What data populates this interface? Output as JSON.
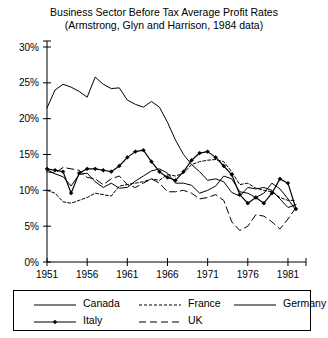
{
  "chart_data": {
    "type": "line",
    "title": "Business Sector Before Tax Average Profit Rates",
    "subtitle": "(Armstrong, Glyn and Harrison, 1984 data)",
    "xlabel": "",
    "ylabel": "",
    "xlim": [
      1951,
      1982
    ],
    "ylim": [
      0,
      30
    ],
    "grid": false,
    "legend_position": "bottom",
    "x_tick_labels": [
      "1951",
      "1956",
      "1961",
      "1966",
      "1971",
      "1976",
      "1981"
    ],
    "x_ticks": [
      1951,
      1956,
      1961,
      1966,
      1971,
      1976,
      1981
    ],
    "y_tick_labels": [
      "0%",
      "5%",
      "10%",
      "15%",
      "20%",
      "25%",
      "30%"
    ],
    "y_ticks": [
      0,
      5,
      10,
      15,
      20,
      25,
      30
    ],
    "x": [
      1951,
      1952,
      1953,
      1954,
      1955,
      1956,
      1957,
      1958,
      1959,
      1960,
      1961,
      1962,
      1963,
      1964,
      1965,
      1966,
      1967,
      1968,
      1969,
      1970,
      1971,
      1972,
      1973,
      1974,
      1975,
      1976,
      1977,
      1978,
      1979,
      1980,
      1981,
      1982
    ],
    "series": [
      {
        "name": "Canada",
        "style": "solid",
        "marker": "none",
        "color": "#000000",
        "values": [
          12.9,
          12.3,
          11.9,
          10.6,
          12.2,
          12.4,
          11.2,
          10.4,
          11.0,
          10.3,
          10.4,
          11.3,
          12.0,
          12.7,
          13.0,
          12.4,
          11.0,
          11.0,
          10.7,
          9.6,
          10.0,
          10.6,
          12.0,
          11.6,
          9.8,
          9.6,
          9.0,
          9.6,
          11.0,
          10.2,
          8.8,
          7.2
        ]
      },
      {
        "name": "France",
        "style": "dotted",
        "marker": "none",
        "color": "#000000",
        "values": [
          10.0,
          9.6,
          8.4,
          8.2,
          8.6,
          9.0,
          9.6,
          9.4,
          9.2,
          10.6,
          10.8,
          11.0,
          11.2,
          11.6,
          11.4,
          12.2,
          12.0,
          12.4,
          13.6,
          14.0,
          14.2,
          14.3,
          14.0,
          12.6,
          10.8,
          11.0,
          10.3,
          10.0,
          9.8,
          9.0,
          8.6,
          8.6
        ]
      },
      {
        "name": "Germany",
        "style": "solid",
        "marker": "none",
        "color": "#000000",
        "values": [
          21.5,
          24.0,
          24.8,
          24.4,
          23.8,
          23.0,
          25.8,
          24.8,
          24.2,
          24.3,
          22.6,
          22.0,
          21.6,
          22.4,
          21.6,
          19.5,
          17.0,
          15.0,
          13.6,
          12.6,
          11.4,
          11.6,
          11.2,
          9.7,
          9.2,
          10.4,
          10.2,
          10.4,
          10.0,
          8.8,
          7.6,
          8.0
        ]
      },
      {
        "name": "Italy",
        "style": "solid",
        "marker": "diamond",
        "color": "#000000",
        "values": [
          13.0,
          12.8,
          12.6,
          9.6,
          12.4,
          13.0,
          13.0,
          12.8,
          12.6,
          13.4,
          14.6,
          15.4,
          15.6,
          14.0,
          12.6,
          11.8,
          11.4,
          12.6,
          14.2,
          15.2,
          15.4,
          14.6,
          13.4,
          12.2,
          9.4,
          8.2,
          9.0,
          8.2,
          9.6,
          11.6,
          11.0,
          7.4
        ]
      },
      {
        "name": "UK",
        "style": "dashed",
        "marker": "none",
        "color": "#000000",
        "values": [
          12.6,
          12.4,
          13.2,
          13.0,
          12.8,
          11.8,
          11.6,
          10.8,
          11.6,
          12.0,
          10.8,
          10.4,
          11.0,
          11.6,
          11.0,
          9.8,
          9.8,
          10.0,
          9.6,
          8.8,
          9.0,
          9.4,
          8.6,
          5.6,
          4.4,
          5.0,
          6.6,
          6.4,
          5.6,
          4.6,
          6.0,
          7.6
        ]
      }
    ]
  },
  "legend": {
    "items": [
      {
        "label": "Canada",
        "style": "solid",
        "marker": "none"
      },
      {
        "label": "France",
        "style": "dotted",
        "marker": "none"
      },
      {
        "label": "Germany",
        "style": "solid",
        "marker": "none"
      },
      {
        "label": "Italy",
        "style": "solid",
        "marker": "diamond"
      },
      {
        "label": "UK",
        "style": "dashed",
        "marker": "none"
      }
    ]
  }
}
